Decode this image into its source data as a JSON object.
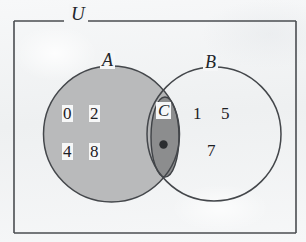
{
  "figure": {
    "type": "venn-diagram",
    "background_color": "#f3f4f5",
    "stroke_color": "#45484c"
  },
  "universe": {
    "label": "U",
    "rect": {
      "x": 14,
      "y": 21,
      "width": 282,
      "height": 212
    },
    "label_position": {
      "x": 73,
      "y": 13
    }
  },
  "sets": [
    {
      "id": "A",
      "label": "A",
      "shape": "circle",
      "cx": 111.5,
      "cy": 134,
      "r": 68,
      "fill": "#b9babb",
      "label_position": {
        "x": 104,
        "y": 56
      },
      "elements": [
        "0",
        "2",
        "4",
        "8"
      ]
    },
    {
      "id": "B",
      "label": "B",
      "shape": "circle",
      "cx": 214,
      "cy": 134,
      "r": 67,
      "fill": "none",
      "label_position": {
        "x": 207,
        "y": 58
      },
      "elements": [
        "1",
        "5",
        "7"
      ]
    },
    {
      "id": "C",
      "label": "C",
      "shape": "ellipse",
      "cx": 165,
      "cy": 137,
      "rx": 14,
      "ry": 40,
      "fill": "#8c8d8e",
      "label_position": {
        "x": 158,
        "y": 107
      },
      "elements": [
        "dot"
      ]
    }
  ],
  "elements": {
    "a_only": [
      {
        "value": "0",
        "x": 68,
        "y": 113
      },
      {
        "value": "2",
        "x": 94,
        "y": 113
      },
      {
        "value": "4",
        "x": 68,
        "y": 151
      },
      {
        "value": "8",
        "x": 94,
        "y": 151
      }
    ],
    "b_only": [
      {
        "value": "1",
        "x": 197,
        "y": 113
      },
      {
        "value": "5",
        "x": 225,
        "y": 113
      },
      {
        "value": "7",
        "x": 211,
        "y": 150
      }
    ],
    "c_point": {
      "x": 163.5,
      "y": 144.5,
      "r": 4.2,
      "color": "#2b2d30"
    }
  }
}
